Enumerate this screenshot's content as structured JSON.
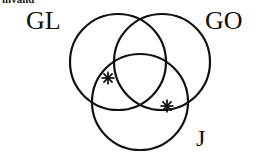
{
  "figure": {
    "name": "three-set-venn-diagram",
    "background_color": "#ffffff",
    "stroke_color": "#111111",
    "clipped_caption": "invalid"
  },
  "sets": [
    {
      "id": "GL",
      "label": "GL",
      "position": "top-left",
      "circle": {
        "cx": 118,
        "cy": 62,
        "r": 48
      }
    },
    {
      "id": "GO",
      "label": "GO",
      "position": "top-right",
      "circle": {
        "cx": 162,
        "cy": 62,
        "r": 48
      }
    },
    {
      "id": "J",
      "label": "J",
      "position": "bottom",
      "circle": {
        "cx": 140,
        "cy": 102,
        "r": 48
      }
    }
  ],
  "markers": [
    {
      "name": "asterisk-marker-left",
      "glyph": "*",
      "x": 108,
      "y": 78,
      "region": "GL-and-J boundary"
    },
    {
      "name": "asterisk-marker-right",
      "glyph": "*",
      "x": 167,
      "y": 106,
      "region": "GO-and-J boundary"
    }
  ],
  "style": {
    "stroke_width": 2.2,
    "label_font_size_large": 26,
    "label_font_size_small": 24
  }
}
